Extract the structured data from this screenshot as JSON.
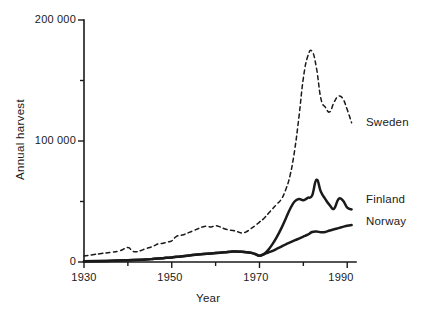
{
  "chart_data": {
    "type": "line",
    "title": "",
    "xlabel": "Year",
    "ylabel": "Annual harvest",
    "xlim": [
      1930,
      1992
    ],
    "ylim": [
      0,
      200000
    ],
    "grid": false,
    "legend_position": "right-inline",
    "xticks": [
      1930,
      1950,
      1970,
      1990
    ],
    "xtick_labels": [
      "1930",
      "1950",
      "1970",
      "1990"
    ],
    "xminor_ticks": [
      1940,
      1960,
      1980
    ],
    "yticks": [
      0,
      100000,
      200000
    ],
    "ytick_labels": [
      "0",
      "100 000",
      "200 000"
    ],
    "yminor_ticks": [
      50000,
      150000
    ],
    "series": [
      {
        "name": "Sweden",
        "style": "dashed",
        "x": [
          1930,
          1932,
          1934,
          1936,
          1938,
          1940,
          1941,
          1942,
          1943,
          1944,
          1945,
          1946,
          1947,
          1948,
          1949,
          1950,
          1951,
          1952,
          1953,
          1954,
          1955,
          1956,
          1957,
          1958,
          1959,
          1960,
          1961,
          1962,
          1963,
          1964,
          1965,
          1966,
          1967,
          1968,
          1969,
          1970,
          1971,
          1972,
          1973,
          1974,
          1975,
          1976,
          1977,
          1978,
          1979,
          1980,
          1981,
          1982,
          1983,
          1984,
          1985,
          1986,
          1987,
          1988,
          1989,
          1990,
          1991
        ],
        "values": [
          5000,
          6000,
          7000,
          8000,
          9000,
          12000,
          9000,
          8500,
          9500,
          11000,
          12000,
          13500,
          15000,
          15500,
          16500,
          17500,
          21000,
          22000,
          23000,
          24500,
          26000,
          27500,
          29000,
          29500,
          29000,
          30000,
          29000,
          27500,
          26500,
          26000,
          25000,
          24000,
          25000,
          27500,
          30000,
          33000,
          36000,
          40000,
          44000,
          48000,
          52000,
          60000,
          72000,
          92000,
          120000,
          152000,
          170000,
          174000,
          160000,
          135000,
          128000,
          124000,
          132000,
          137000,
          135000,
          126000,
          115000
        ]
      },
      {
        "name": "Finland",
        "style": "solid",
        "x": [
          1930,
          1935,
          1940,
          1944,
          1946,
          1948,
          1950,
          1952,
          1954,
          1956,
          1958,
          1960,
          1962,
          1964,
          1966,
          1968,
          1969,
          1970,
          1971,
          1972,
          1973,
          1974,
          1975,
          1976,
          1977,
          1978,
          1979,
          1980,
          1981,
          1982,
          1983,
          1984,
          1985,
          1986,
          1987,
          1988,
          1989,
          1990,
          1991
        ],
        "values": [
          600,
          900,
          1400,
          2000,
          2600,
          3200,
          3800,
          4600,
          5400,
          6200,
          6800,
          7400,
          8000,
          8600,
          8400,
          7600,
          6600,
          5200,
          6500,
          10000,
          15000,
          21000,
          28000,
          36000,
          44000,
          50000,
          52000,
          51000,
          53000,
          55000,
          68000,
          58000,
          52000,
          47000,
          44000,
          52000,
          51000,
          45000,
          43500
        ]
      },
      {
        "name": "Norway",
        "style": "solid",
        "x": [
          1930,
          1935,
          1940,
          1944,
          1946,
          1948,
          1950,
          1952,
          1954,
          1956,
          1958,
          1960,
          1962,
          1964,
          1966,
          1968,
          1969,
          1970,
          1971,
          1972,
          1973,
          1974,
          1975,
          1976,
          1977,
          1978,
          1979,
          1980,
          1981,
          1982,
          1983,
          1984,
          1985,
          1986,
          1987,
          1988,
          1989,
          1990,
          1991
        ],
        "values": [
          600,
          900,
          1400,
          2000,
          2600,
          3200,
          3800,
          4600,
          5400,
          6200,
          6800,
          7400,
          8000,
          8600,
          8400,
          7600,
          6600,
          5200,
          6400,
          7800,
          9200,
          11000,
          12800,
          14600,
          16200,
          17800,
          19400,
          21000,
          22600,
          24800,
          25200,
          24600,
          24800,
          26000,
          27000,
          28000,
          29000,
          30000,
          30500
        ]
      }
    ]
  },
  "labels": {
    "ytick_200000": "200 000",
    "ytick_100000": "100 000",
    "ytick_0": "0",
    "xtick_1930": "1930",
    "xtick_1950": "1950",
    "xtick_1970": "1970",
    "xtick_1990": "1990",
    "y_axis_title": "Annual harvest",
    "x_axis_title": "Year",
    "series_sweden": "Sweden",
    "series_finland": "Finland",
    "series_norway": "Norway"
  },
  "colors": {
    "ink": "#1a1a1a",
    "background": "#ffffff"
  }
}
